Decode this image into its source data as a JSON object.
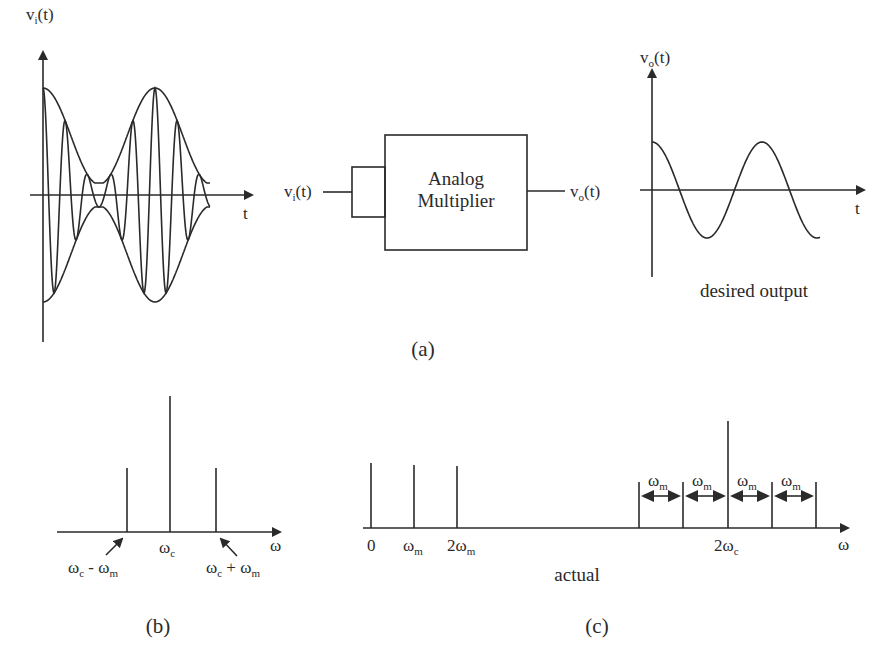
{
  "figure": {
    "panel_a": {
      "caption": "(a)",
      "input_plot": {
        "y_label": "v",
        "y_label_sub": "i",
        "y_label_suffix": "(t)",
        "x_label": "t",
        "description": "AM modulated carrier with envelope"
      },
      "block": {
        "title_line1": "Analog",
        "title_line2": "Multiplier",
        "input_label": "v",
        "input_label_sub": "i",
        "input_label_suffix": "(t)",
        "output_label": "v",
        "output_label_sub": "o",
        "output_label_suffix": "(t)"
      },
      "output_plot": {
        "y_label": "v",
        "y_label_sub": "o",
        "y_label_suffix": "(t)",
        "x_label": "t",
        "caption": "desired output"
      }
    },
    "panel_b": {
      "caption": "(b)",
      "x_label": "ω",
      "center_label": "ω",
      "center_label_sub": "c",
      "lower_label": "ω",
      "lower_label_sub": "c",
      "lower_label_mid": " - ω",
      "lower_label_sub2": "m",
      "upper_label": "ω",
      "upper_label_sub": "c",
      "upper_label_mid": " + ω",
      "upper_label_sub2": "m"
    },
    "panel_c": {
      "caption": "(c)",
      "sub_caption": "actual",
      "x_label": "ω",
      "tick_0": "0",
      "tick_wm": "ω",
      "tick_wm_sub": "m",
      "tick_2wm": "2ω",
      "tick_2wm_sub": "m",
      "tick_2wc": "2ω",
      "tick_2wc_sub": "c",
      "spacing_label": "ω",
      "spacing_label_sub": "m"
    }
  },
  "chart_data": [
    {
      "type": "line",
      "title": "v_i(t) input (AM signal)",
      "xlabel": "t",
      "ylabel": "v_i(t)",
      "series": [
        {
          "name": "envelope",
          "values": "cosine modulated, peaks at t=0 and mid"
        }
      ]
    },
    {
      "type": "line",
      "title": "v_o(t) desired output",
      "xlabel": "t",
      "ylabel": "v_o(t)",
      "series": [
        {
          "name": "v_o",
          "values": "cosine, ~1.75 periods"
        }
      ]
    },
    {
      "type": "bar",
      "title": "(b) input spectrum",
      "xlabel": "ω",
      "categories": [
        "ωc - ωm",
        "ωc",
        "ωc + ωm"
      ],
      "values": [
        0.6,
        1.0,
        0.6
      ]
    },
    {
      "type": "bar",
      "title": "(c) actual output spectrum",
      "xlabel": "ω",
      "categories": [
        "0",
        "ωm",
        "2ωm",
        "2ωc-2ωm",
        "2ωc-ωm",
        "2ωc",
        "2ωc+ωm",
        "2ωc+2ωm"
      ],
      "values": [
        0.6,
        0.6,
        0.6,
        0.4,
        0.4,
        1.0,
        0.4,
        0.4
      ]
    }
  ]
}
